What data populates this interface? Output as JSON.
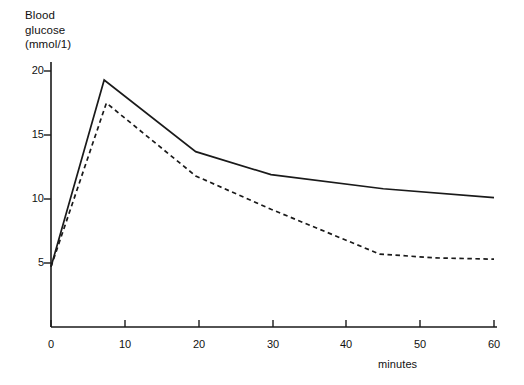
{
  "chart_data": {
    "type": "line",
    "title": "",
    "ylabel_lines": [
      "Blood",
      "glucose",
      "(mmol/1)"
    ],
    "ylabel": "Blood glucose (mmol/1)",
    "xlabel": "minutes",
    "xlim": [
      0,
      60
    ],
    "ylim": [
      0,
      21.5
    ],
    "grid": false,
    "legend": "none",
    "xticks": [
      0,
      10,
      20,
      30,
      40,
      50,
      60
    ],
    "xtick_labels": [
      "0",
      "10",
      "20",
      "30",
      "40",
      "50",
      "60"
    ],
    "yticks": [
      5,
      10,
      15,
      20
    ],
    "ytick_labels": [
      "5",
      "10",
      "15",
      "20"
    ],
    "series": [
      {
        "name": "solid-curve",
        "style": "solid",
        "color": "#1a1a1a",
        "x": [
          0,
          7.2,
          19.6,
          29.8,
          45.0,
          60.0
        ],
        "values": [
          4.7,
          19.3,
          13.7,
          11.9,
          10.8,
          10.1
        ]
      },
      {
        "name": "dashed-curve",
        "style": "dashed",
        "color": "#1a1a1a",
        "x": [
          0,
          7.5,
          19.6,
          29.8,
          44.5,
          52.0,
          60.0
        ],
        "values": [
          4.7,
          17.5,
          11.8,
          9.2,
          5.7,
          5.4,
          5.3
        ]
      }
    ]
  }
}
